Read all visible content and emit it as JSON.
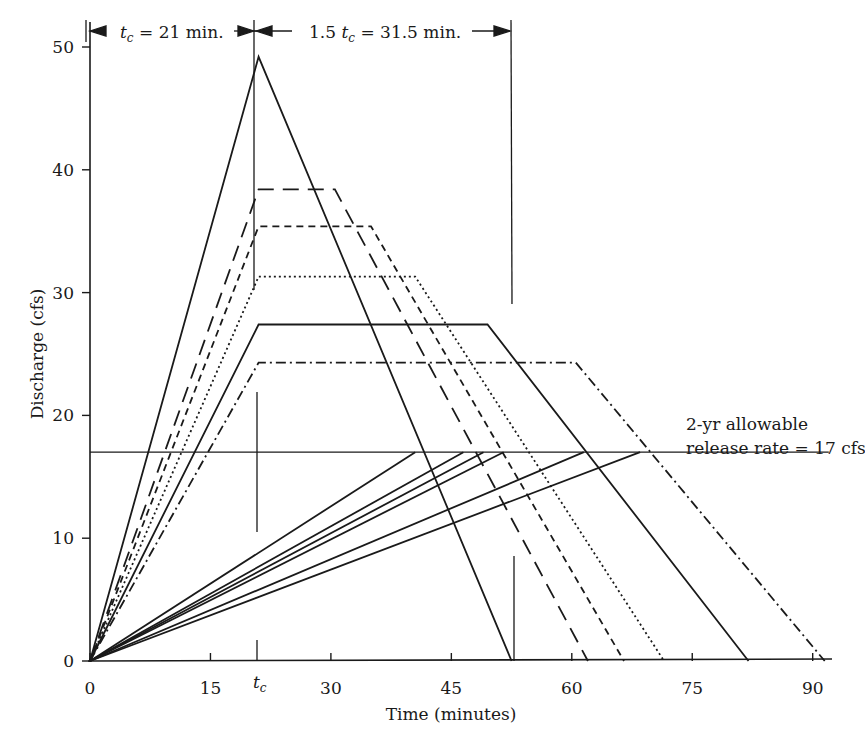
{
  "chart_data": {
    "type": "line",
    "title": "",
    "xlabel": "Time (minutes)",
    "ylabel": "Discharge (cfs)",
    "xlim": [
      0,
      92
    ],
    "ylim": [
      0,
      52
    ],
    "grid": false,
    "legend": "none",
    "x_ticks": [
      0,
      15,
      30,
      45,
      60,
      75,
      90
    ],
    "x_tick_labels": [
      "0",
      "15",
      "30",
      "45",
      "60",
      "75",
      "90"
    ],
    "extra_x_tick": {
      "value": 21,
      "label": "t",
      "subscript": "c"
    },
    "y_ticks": [
      0,
      10,
      20,
      30,
      40,
      50
    ],
    "y_tick_labels": [
      "0",
      "10",
      "20",
      "30",
      "40",
      "50"
    ],
    "series": [
      {
        "name": "Triangular inflow hydrograph",
        "style": "solid",
        "x": [
          0,
          21,
          52.5
        ],
        "y": [
          0,
          49.2,
          0
        ]
      },
      {
        "name": "Trapezoidal hydrograph 1",
        "style": "long-dash",
        "x": [
          0,
          21,
          30.5,
          62
        ],
        "y": [
          0,
          38.4,
          38.4,
          0
        ]
      },
      {
        "name": "Trapezoidal hydrograph 2",
        "style": "short-dash",
        "x": [
          0,
          21,
          35,
          66.5
        ],
        "y": [
          0,
          35.4,
          35.4,
          0
        ]
      },
      {
        "name": "Trapezoidal hydrograph 3",
        "style": "dotted",
        "x": [
          0,
          21,
          40.5,
          71.5
        ],
        "y": [
          0,
          31.3,
          31.3,
          0
        ]
      },
      {
        "name": "Trapezoidal hydrograph 4",
        "style": "solid",
        "x": [
          0,
          21,
          49.5,
          82
        ],
        "y": [
          0,
          27.4,
          27.4,
          0
        ]
      },
      {
        "name": "Trapezoidal hydrograph 5",
        "style": "dash-dot",
        "x": [
          0,
          21,
          60.5,
          91.5
        ],
        "y": [
          0,
          24.3,
          24.3,
          0
        ]
      },
      {
        "name": "Allowable release rate",
        "style": "solid",
        "x": [
          0,
          92
        ],
        "y": [
          17,
          17
        ]
      },
      {
        "name": "Outflow 1",
        "style": "solid",
        "x": [
          0,
          40.5
        ],
        "y": [
          0,
          17
        ]
      },
      {
        "name": "Outflow 2",
        "style": "solid",
        "x": [
          0,
          46.5
        ],
        "y": [
          0,
          17
        ]
      },
      {
        "name": "Outflow 3",
        "style": "solid",
        "x": [
          0,
          49
        ],
        "y": [
          0,
          17
        ]
      },
      {
        "name": "Outflow 4",
        "style": "solid",
        "x": [
          0,
          51.5
        ],
        "y": [
          0,
          17
        ]
      },
      {
        "name": "Outflow 5",
        "style": "solid",
        "x": [
          0,
          61.5
        ],
        "y": [
          0,
          17
        ]
      },
      {
        "name": "Outflow 6",
        "style": "solid",
        "x": [
          0,
          68.5
        ],
        "y": [
          0,
          17
        ]
      }
    ],
    "annotations": [
      {
        "text": "t_c = 21 min.",
        "type": "dimension",
        "x_from": 0,
        "x_to": 21
      },
      {
        "text": "1.5 t_c = 31.5 min.",
        "type": "dimension",
        "x_from": 21,
        "x_to": 52.5
      },
      {
        "text": "2-yr allowable release rate = 17 cfs",
        "type": "label",
        "at": [
          70,
          17
        ]
      }
    ],
    "reference_lines": [
      {
        "orientation": "vertical",
        "x": 21,
        "label": "t_c"
      },
      {
        "orientation": "vertical",
        "x": 52.5
      }
    ]
  },
  "labels": {
    "dim1_t": "t",
    "dim1_sub": "c",
    "dim1_rest": " = 21 min.",
    "dim2_pre": "1.5 ",
    "dim2_t": "t",
    "dim2_sub": "c",
    "dim2_rest": " = 31.5 min.",
    "release_line1": "2-yr allowable",
    "release_line2": "release rate = 17 cfs",
    "tc_t": "t",
    "tc_sub": "c"
  }
}
